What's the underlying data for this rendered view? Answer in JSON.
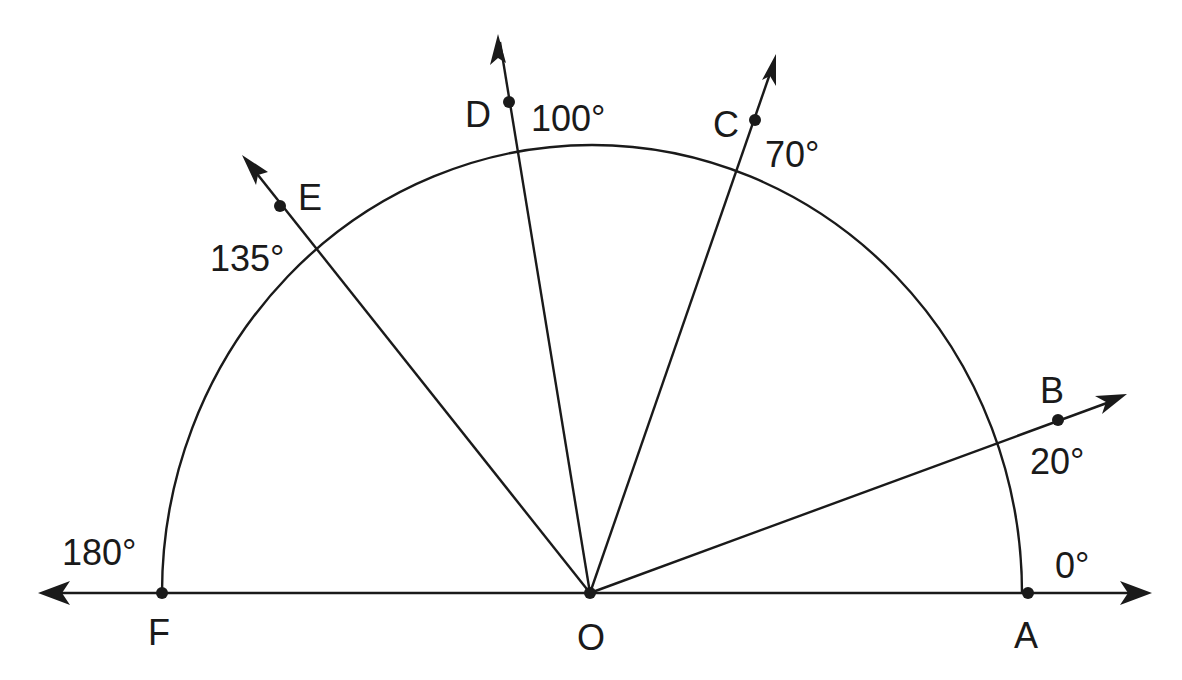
{
  "diagram": {
    "type": "protractor-angle-diagram",
    "vertex": {
      "label": "O",
      "x": 590,
      "y": 593
    },
    "radius": 430,
    "points": [
      {
        "label": "A",
        "angle": 0,
        "x": 1028,
        "y": 593
      },
      {
        "label": "B",
        "angle": 20,
        "x": 1058,
        "y": 420
      },
      {
        "label": "C",
        "angle": 70,
        "x": 755,
        "y": 120
      },
      {
        "label": "D",
        "angle": 100,
        "x": 508,
        "y": 102
      },
      {
        "label": "E",
        "angle": 135,
        "x": 280,
        "y": 206
      },
      {
        "label": "F",
        "angle": 180,
        "x": 162,
        "y": 593
      }
    ],
    "angle_labels": [
      {
        "text": "0°",
        "angle": 0
      },
      {
        "text": "20°",
        "angle": 20
      },
      {
        "text": "70°",
        "angle": 70
      },
      {
        "text": "100°",
        "angle": 100
      },
      {
        "text": "135°",
        "angle": 135
      },
      {
        "text": "180°",
        "angle": 180
      }
    ],
    "colors": {
      "stroke": "#1a1a1a",
      "background": "#ffffff"
    }
  }
}
